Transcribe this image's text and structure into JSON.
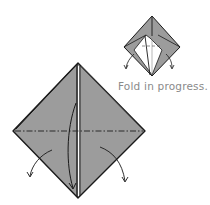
{
  "diagram": {
    "type": "origami-fold-step",
    "caption": "Fold in progress.",
    "colors": {
      "paper_fill": "#9c9c9c",
      "outline": "#1a1a1a",
      "inner_white": "#ffffff",
      "caption": "#8a8a8a"
    },
    "large_model": {
      "shape": "diamond",
      "fold_line": "mountain (dash-dot) horizontal",
      "arrows": [
        "left flap folds down-left",
        "right flap folds down-right",
        "center flap curved arrow downward"
      ]
    },
    "small_model": {
      "shape": "diamond partially opened",
      "arrows": [
        "left down",
        "right down"
      ]
    }
  }
}
